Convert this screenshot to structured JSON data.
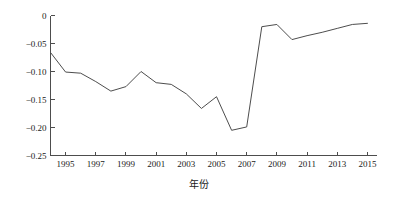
{
  "chart_data": {
    "type": "line",
    "title": "",
    "subtitle": "",
    "xlabel": "年份",
    "ylabel": "",
    "grid": false,
    "legend": false,
    "xlim": [
      1994,
      2015.6
    ],
    "ylim": [
      -0.25,
      0
    ],
    "x_tick_labels": [
      "1995",
      "1997",
      "1999",
      "2001",
      "2003",
      "2005",
      "2007",
      "2009",
      "2011",
      "2013",
      "2015"
    ],
    "x_ticks": [
      1995,
      1997,
      1999,
      2001,
      2003,
      2005,
      2007,
      2009,
      2011,
      2013,
      2015
    ],
    "y_tick_labels": [
      "0",
      "−0.05",
      "−0.10",
      "−0.15",
      "−0.20",
      "−0.25"
    ],
    "y_ticks": [
      0,
      -0.05,
      -0.1,
      -0.15,
      -0.2,
      -0.25
    ],
    "x": [
      1994,
      1995,
      1996,
      1997,
      1998,
      1999,
      2000,
      2001,
      2002,
      2003,
      2004,
      2005,
      2006,
      2007,
      2008,
      2009,
      2010,
      2011,
      2012,
      2013,
      2014,
      2015
    ],
    "values": [
      -0.066,
      -0.101,
      -0.103,
      -0.118,
      -0.135,
      -0.127,
      -0.1,
      -0.12,
      -0.123,
      -0.14,
      -0.166,
      -0.145,
      -0.205,
      -0.199,
      -0.02,
      -0.016,
      -0.043,
      -0.036,
      -0.03,
      -0.023,
      -0.016,
      -0.014
    ],
    "series": [
      {
        "name": "series-1",
        "color": "#4d4d4d",
        "values": [
          -0.066,
          -0.101,
          -0.103,
          -0.118,
          -0.135,
          -0.127,
          -0.1,
          -0.12,
          -0.123,
          -0.14,
          -0.166,
          -0.145,
          -0.205,
          -0.199,
          -0.02,
          -0.016,
          -0.043,
          -0.036,
          -0.03,
          -0.023,
          -0.016,
          -0.014
        ]
      }
    ],
    "axis_color": "#4d4d4d",
    "background_color": "#ffffff"
  }
}
